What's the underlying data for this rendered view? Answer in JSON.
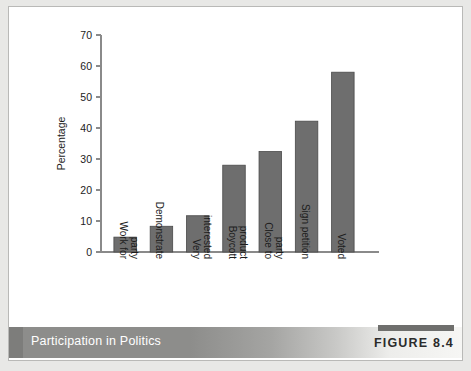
{
  "figure": {
    "caption": "Participation in Politics",
    "number_label": "FIGURE 8.4"
  },
  "colors": {
    "bar_fill": "#6e6e6e",
    "bar_stroke": "#4a4a4a",
    "axis": "#8a8a8a",
    "footer_band_dark": "#8d8d8b",
    "footer_text": "#ffffff",
    "page_background": "#e8e8e6",
    "card_background": "#ffffff"
  },
  "chart_data": {
    "type": "bar",
    "title": "",
    "xlabel": "",
    "ylabel": "Percentage",
    "ylim": [
      0,
      70
    ],
    "yticks": [
      0,
      10,
      20,
      30,
      40,
      50,
      60,
      70
    ],
    "ytick_labels": [
      "0",
      "10",
      "20",
      "30",
      "40",
      "50",
      "60",
      "70"
    ],
    "grid": false,
    "legend": false,
    "categories": [
      "Work for party",
      "Demonstrate",
      "Very interested",
      "Boycott product",
      "Close to party",
      "Sign petition",
      "Voted"
    ],
    "values": [
      4.8,
      8.3,
      11.7,
      28.0,
      32.4,
      42.2,
      58.0
    ]
  }
}
